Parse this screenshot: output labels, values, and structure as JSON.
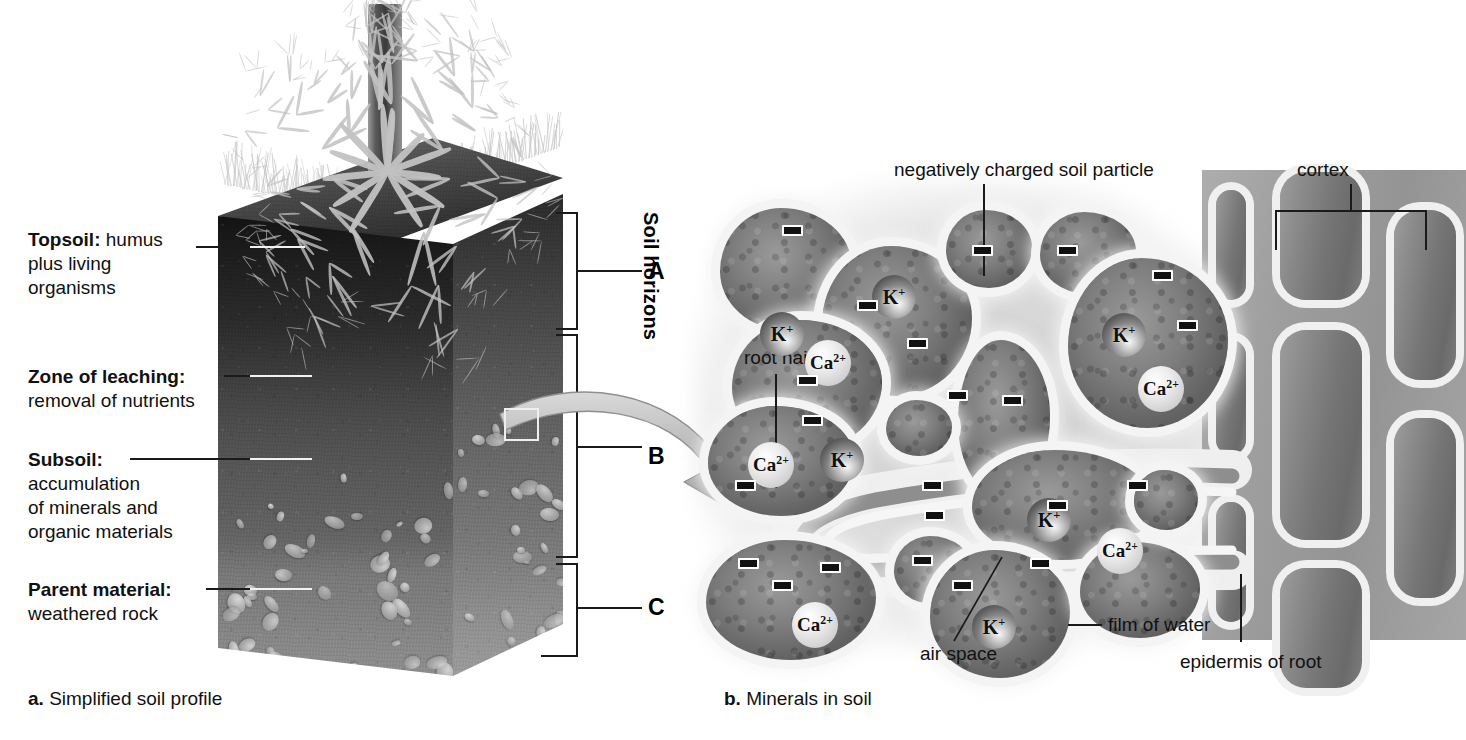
{
  "panel_a": {
    "caption_letter": "a.",
    "caption_text": " Simplified soil profile",
    "horizons_title": "Soil horizons",
    "horizon_letters": [
      "A",
      "B",
      "C"
    ],
    "labels": [
      {
        "bold": "Topsoil:",
        "rest": " humus",
        "lines": [
          "plus living",
          "organisms"
        ]
      },
      {
        "bold": "Zone of leaching:",
        "rest": "",
        "lines": [
          "removal of nutrients"
        ]
      },
      {
        "bold": "Subsoil:",
        "rest": "",
        "lines": [
          "accumulation",
          "of minerals and",
          "organic materials"
        ]
      },
      {
        "bold": "Parent material:",
        "rest": "",
        "lines": [
          "weathered rock"
        ]
      }
    ]
  },
  "panel_b": {
    "caption_letter": "b.",
    "caption_text": " Minerals in soil",
    "labels": {
      "soil_particle": "negatively charged soil particle",
      "cortex": "cortex",
      "root_hair": "root hair",
      "air_space": "air space",
      "film_of_water": "film of water",
      "epidermis": "epidermis of root"
    },
    "ions": [
      {
        "symbol": "K",
        "charge": "+",
        "x": 200,
        "y": 125,
        "d": 44
      },
      {
        "symbol": "K",
        "charge": "+",
        "x": 88,
        "y": 162,
        "d": 44
      },
      {
        "symbol": "Ca",
        "charge": "2+",
        "x": 133,
        "y": 190,
        "d": 46
      },
      {
        "symbol": "K",
        "charge": "+",
        "x": 430,
        "y": 163,
        "d": 44
      },
      {
        "symbol": "Ca",
        "charge": "2+",
        "x": 466,
        "y": 216,
        "d": 46
      },
      {
        "symbol": "Ca",
        "charge": "2+",
        "x": 76,
        "y": 292,
        "d": 46
      },
      {
        "symbol": "K",
        "charge": "+",
        "x": 148,
        "y": 288,
        "d": 44
      },
      {
        "symbol": "K",
        "charge": "+",
        "x": 355,
        "y": 348,
        "d": 44
      },
      {
        "symbol": "Ca",
        "charge": "2+",
        "x": 425,
        "y": 378,
        "d": 46
      },
      {
        "symbol": "Ca",
        "charge": "2+",
        "x": 120,
        "y": 452,
        "d": 46
      },
      {
        "symbol": "K",
        "charge": "+",
        "x": 300,
        "y": 455,
        "d": 44
      }
    ],
    "charge_marks": [
      {
        "x": 110,
        "y": 75
      },
      {
        "x": 185,
        "y": 150
      },
      {
        "x": 125,
        "y": 225
      },
      {
        "x": 235,
        "y": 188
      },
      {
        "x": 130,
        "y": 265
      },
      {
        "x": 275,
        "y": 240
      },
      {
        "x": 250,
        "y": 330
      },
      {
        "x": 300,
        "y": 95
      },
      {
        "x": 385,
        "y": 95
      },
      {
        "x": 330,
        "y": 245
      },
      {
        "x": 480,
        "y": 120
      },
      {
        "x": 505,
        "y": 170
      },
      {
        "x": 455,
        "y": 330
      },
      {
        "x": 252,
        "y": 360
      },
      {
        "x": 66,
        "y": 408
      },
      {
        "x": 148,
        "y": 412
      },
      {
        "x": 240,
        "y": 405
      },
      {
        "x": 358,
        "y": 408
      },
      {
        "x": 100,
        "y": 430
      },
      {
        "x": 280,
        "y": 430
      },
      {
        "x": 375,
        "y": 350
      },
      {
        "x": 63,
        "y": 330
      }
    ]
  }
}
